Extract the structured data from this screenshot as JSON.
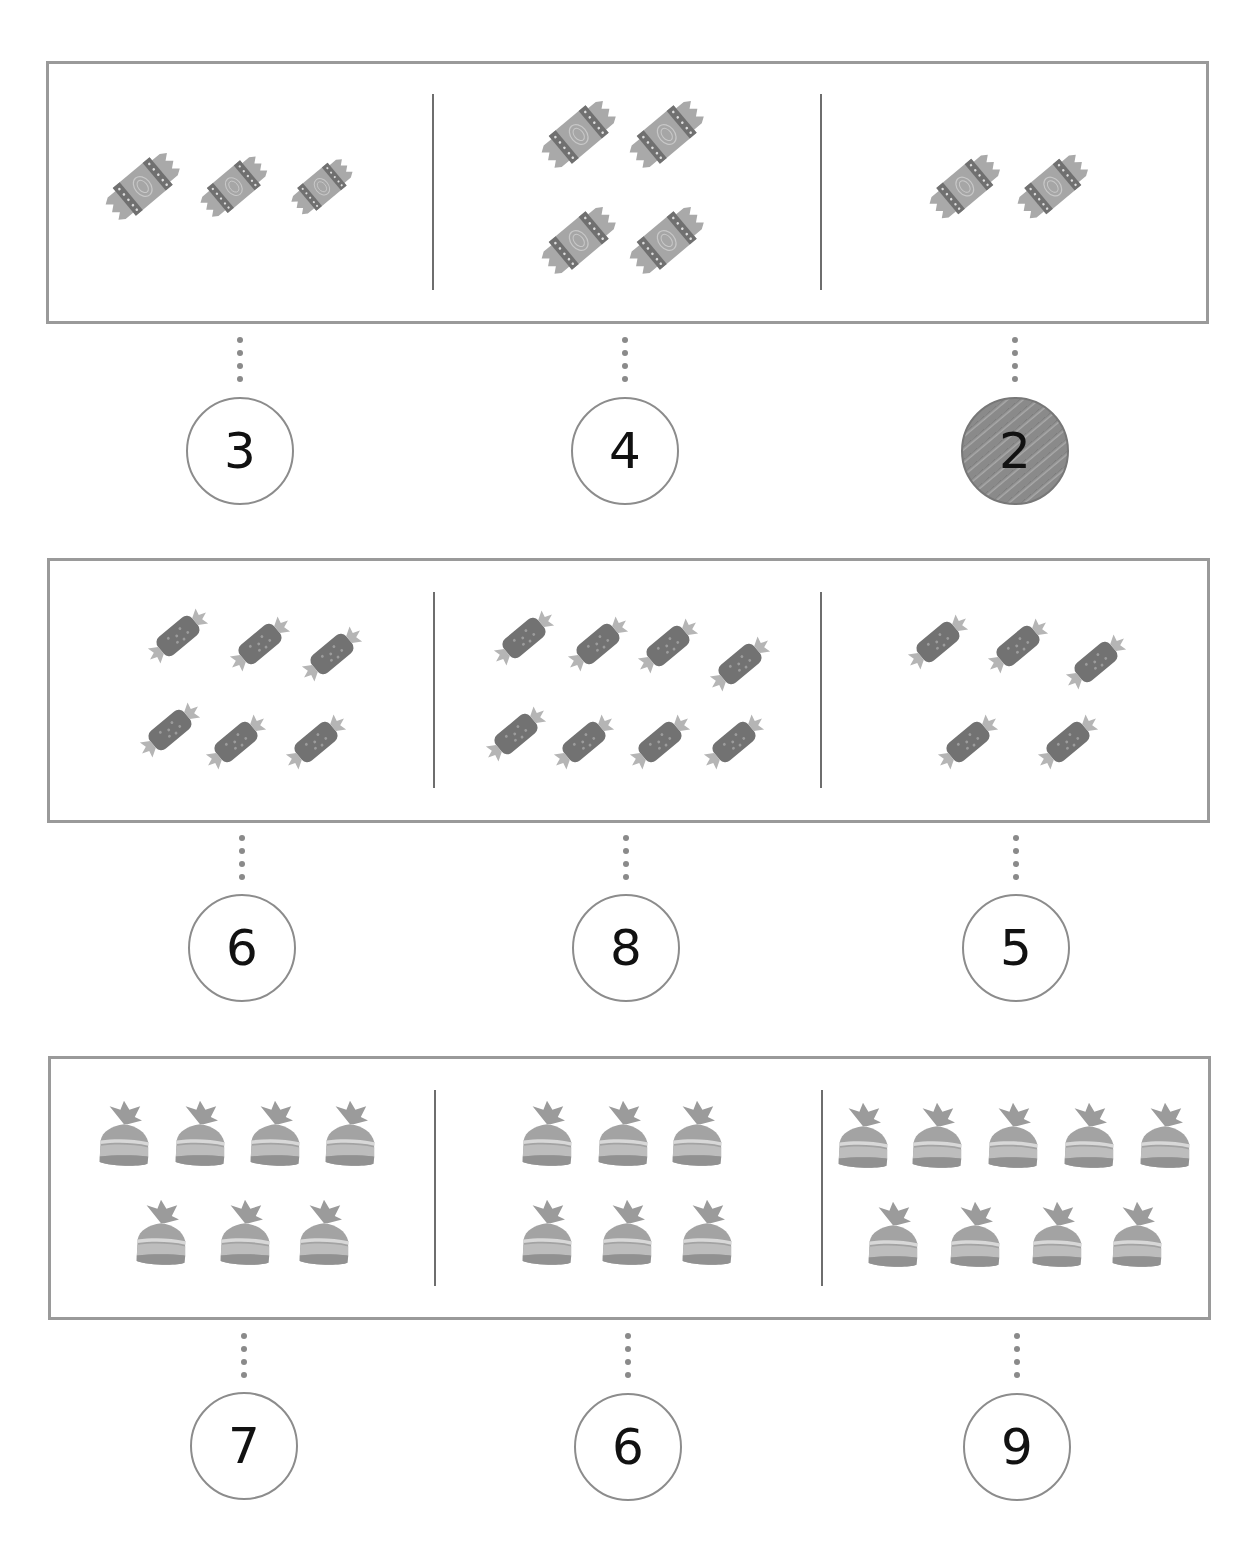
{
  "worksheet": {
    "rows": [
      {
        "candy_type": "wrapped-candy",
        "groups": [
          {
            "count": 3,
            "answer": "3",
            "selected": false
          },
          {
            "count": 4,
            "answer": "4",
            "selected": false
          },
          {
            "count": 2,
            "answer": "2",
            "selected": true
          }
        ]
      },
      {
        "candy_type": "stick-candy",
        "groups": [
          {
            "count": 6,
            "answer": "6",
            "selected": false
          },
          {
            "count": 8,
            "answer": "8",
            "selected": false
          },
          {
            "count": 5,
            "answer": "5",
            "selected": false
          }
        ]
      },
      {
        "candy_type": "bag-candy",
        "groups": [
          {
            "count": 7,
            "answer": "7",
            "selected": false
          },
          {
            "count": 6,
            "answer": "6",
            "selected": false
          },
          {
            "count": 9,
            "answer": "9",
            "selected": false
          }
        ]
      }
    ]
  },
  "colors": {
    "border": "#9a9a9a",
    "divider": "#6e6e6e",
    "candy_light": "#a8a8a8",
    "candy_dark": "#6f6f6f",
    "selected_fill": "#8a8a8a"
  }
}
